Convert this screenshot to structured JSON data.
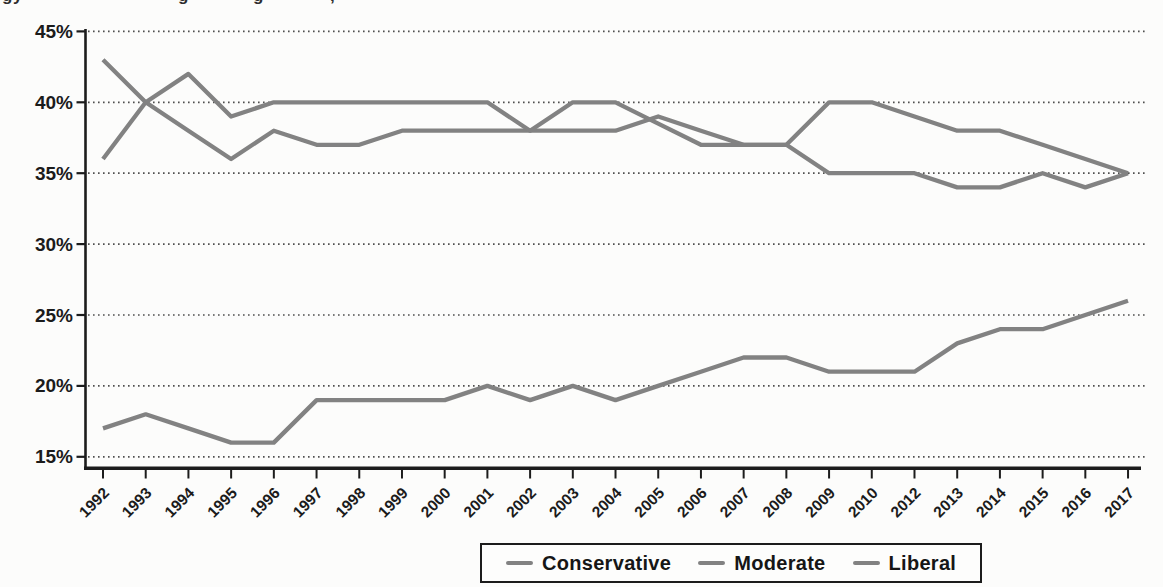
{
  "caption_fragments": [
    {
      "text": "gy",
      "x": 2
    },
    {
      "text": "g",
      "x": 178
    },
    {
      "text": "g",
      "x": 253
    },
    {
      "text": ",",
      "x": 330
    }
  ],
  "colors": {
    "background": "#fcfcfb",
    "line": "#828282",
    "axis": "#1c1c1c",
    "grid_dots": "#4f4f4f",
    "text": "#1b1b1b",
    "legend_border": "#1c1c1c"
  },
  "legend": {
    "position": "bottom-center",
    "items": [
      "Conservative",
      "Moderate",
      "Liberal"
    ]
  },
  "chart_data": {
    "type": "line",
    "title": "",
    "xlabel": "",
    "ylabel": "",
    "ylim": [
      15,
      45
    ],
    "y_tick_step": 5,
    "y_tick_labels": [
      "45%",
      "40%",
      "35%",
      "30%",
      "25%",
      "20%",
      "15%"
    ],
    "y_tick_values": [
      45,
      40,
      35,
      30,
      25,
      20,
      15
    ],
    "grid": "horizontal-dotted",
    "legend_position": "bottom-center",
    "line_color": "#828282",
    "categories": [
      "1992",
      "1993",
      "1994",
      "1995",
      "1996",
      "1997",
      "1998",
      "1999",
      "2000",
      "2001",
      "2002",
      "2003",
      "2004",
      "2005",
      "2006",
      "2007",
      "2008",
      "2009",
      "2010",
      "2012",
      "2013",
      "2014",
      "2015",
      "2016",
      "2017"
    ],
    "series": [
      {
        "name": "Conservative",
        "values": [
          36,
          40,
          38,
          36,
          38,
          37,
          37,
          38,
          38,
          38,
          38,
          38,
          38,
          39,
          38,
          37,
          37,
          40,
          40,
          39,
          38,
          38,
          37,
          36,
          35
        ]
      },
      {
        "name": "Moderate",
        "values": [
          43,
          40,
          42,
          39,
          40,
          40,
          40,
          40,
          40,
          40,
          38,
          40,
          40,
          38.5,
          37,
          37,
          37,
          35,
          35,
          35,
          34,
          34,
          35,
          34,
          35
        ]
      },
      {
        "name": "Liberal",
        "values": [
          17,
          18,
          17,
          16,
          16,
          19,
          19,
          19,
          19,
          20,
          19,
          20,
          19,
          20,
          21,
          22,
          22,
          21,
          21,
          21,
          23,
          24,
          24,
          25,
          26
        ]
      }
    ]
  }
}
